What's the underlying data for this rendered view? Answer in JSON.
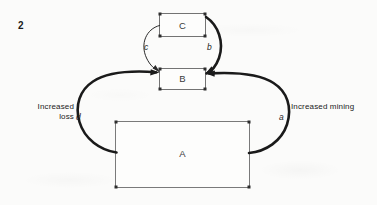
{
  "figure": {
    "number": "2",
    "background_color": "#fbfbfa",
    "ink_color": "#1b1b1b",
    "box_stroke_color": "#6b6b6b"
  },
  "nodes": [
    {
      "id": "node-c",
      "label": "C",
      "x": 159,
      "y": 13,
      "w": 47,
      "h": 24
    },
    {
      "id": "node-b",
      "label": "B",
      "x": 159,
      "y": 68,
      "w": 47,
      "h": 22
    },
    {
      "id": "node-a",
      "label": "A",
      "x": 115,
      "y": 121,
      "w": 135,
      "h": 67
    }
  ],
  "edges": [
    {
      "id": "edge-a",
      "label": "a",
      "from": "A",
      "to": "B",
      "weight": "thick",
      "side": "right"
    },
    {
      "id": "edge-b",
      "label": "b",
      "from": "C",
      "to": "B",
      "weight": "thick",
      "side": "right"
    },
    {
      "id": "edge-c",
      "label": "c",
      "from": "C",
      "to": "B",
      "weight": "thin",
      "side": "left"
    },
    {
      "id": "edge-d",
      "label": "d",
      "from": "A",
      "to": "B",
      "weight": "thick",
      "side": "left"
    }
  ],
  "annotations": {
    "left": "Increased\nloss",
    "right": "Increased  mining"
  }
}
